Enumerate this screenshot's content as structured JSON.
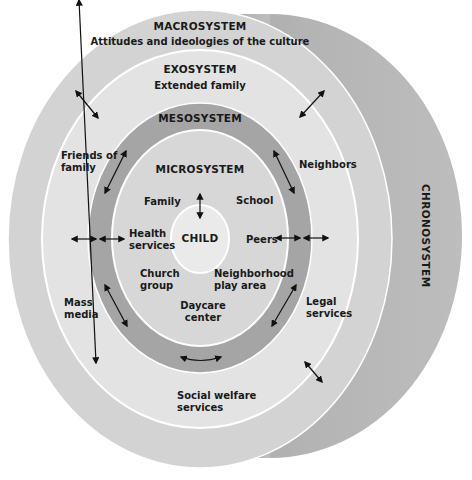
{
  "colors": {
    "background": "#ffffff",
    "chronosystem": "#a9a9a9",
    "macrosystem": "#d2d2d2",
    "exosystem": "#e2e2e2",
    "mesosystem": "#a4a4a4",
    "microsystem": "#d6d6d6",
    "child": "#e9e9e9",
    "ring_stroke": "#ffffff",
    "text": "#1a1a1a"
  },
  "systems": {
    "macrosystem": {
      "title": "MACROSYSTEM",
      "subtitle": "Attitudes and ideologies of the culture"
    },
    "exosystem": {
      "title": "EXOSYSTEM",
      "subtitle": "Extended family"
    },
    "mesosystem": {
      "title": "MESOSYSTEM"
    },
    "microsystem": {
      "title": "MICROSYSTEM"
    },
    "child": {
      "title": "CHILD"
    },
    "chronosystem": {
      "title": "CHRONOSYSTEM"
    }
  },
  "microsystem_items": {
    "family": "Family",
    "school": "School",
    "health_1": "Health",
    "health_2": "services",
    "peers": "Peers",
    "church_1": "Church",
    "church_2": "group",
    "neigh_1": "Neighborhood",
    "neigh_2": "play area",
    "daycare_1": "Daycare",
    "daycare_2": "center"
  },
  "exosystem_items": {
    "friends_1": "Friends of",
    "friends_2": "family",
    "neighbors": "Neighbors",
    "mass_1": "Mass",
    "mass_2": "media",
    "legal_1": "Legal",
    "legal_2": "services",
    "social_1": "Social welfare",
    "social_2": "services"
  },
  "arrows": [
    "bidirectional-arrow"
  ]
}
